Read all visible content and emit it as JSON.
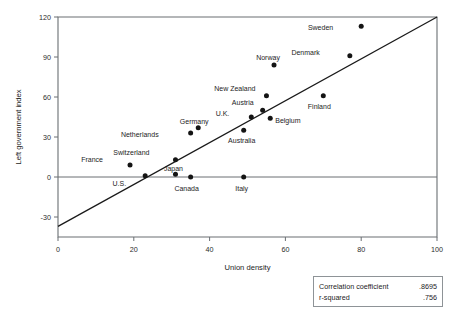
{
  "chart_data": {
    "type": "scatter",
    "title": "",
    "xlabel": "Union density",
    "ylabel": "Left government index",
    "xlim": [
      0,
      100
    ],
    "ylim": [
      -45,
      120
    ],
    "xticks": [
      0,
      20,
      40,
      60,
      80,
      100
    ],
    "yticks": [
      120,
      90,
      60,
      30,
      0,
      -30
    ],
    "grid": false,
    "legend": "none",
    "points": [
      {
        "label": "France",
        "x": 19,
        "y": 9,
        "label_dx": -27,
        "label_dy": -5
      },
      {
        "label": "U.S.",
        "x": 23,
        "y": 1,
        "label_dx": -19,
        "label_dy": 8
      },
      {
        "label": "Switzerland",
        "x": 31,
        "y": 13,
        "label_dx": -26,
        "label_dy": -7
      },
      {
        "label": "Japan",
        "x": 31,
        "y": 2,
        "label_dx": -2,
        "label_dy": -5
      },
      {
        "label": "Netherlands",
        "x": 35,
        "y": 33,
        "label_dx": -32,
        "label_dy": 2
      },
      {
        "label": "Canada",
        "x": 35,
        "y": 0,
        "label_dx": -4,
        "label_dy": 12
      },
      {
        "label": "Germany",
        "x": 37,
        "y": 37,
        "label_dx": -4,
        "label_dy": -6
      },
      {
        "label": "Italy",
        "x": 49,
        "y": 0,
        "label_dx": -2,
        "label_dy": 12
      },
      {
        "label": "Australia",
        "x": 49,
        "y": 35,
        "label_dx": -2,
        "label_dy": 11
      },
      {
        "label": "U.K.",
        "x": 51,
        "y": 45,
        "label_dx": -22,
        "label_dy": -3
      },
      {
        "label": "Austria",
        "x": 54,
        "y": 50,
        "label_dx": -9,
        "label_dy": -7
      },
      {
        "label": "Belgium",
        "x": 56,
        "y": 44,
        "label_dx": 5,
        "label_dy": 3
      },
      {
        "label": "New Zealand",
        "x": 55,
        "y": 61,
        "label_dx": -11,
        "label_dy": -7
      },
      {
        "label": "Norway",
        "x": 57,
        "y": 84,
        "label_dx": -6,
        "label_dy": -7
      },
      {
        "label": "Finland",
        "x": 70,
        "y": 61,
        "label_dx": -4,
        "label_dy": 11
      },
      {
        "label": "Denmark",
        "x": 77,
        "y": 91,
        "label_dx": -30,
        "label_dy": -3
      },
      {
        "label": "Sweden",
        "x": 80,
        "y": 113,
        "label_dx": -28,
        "label_dy": 2
      }
    ],
    "trend_line": {
      "x0": 0,
      "y0": -37,
      "x1": 100,
      "y1": 120
    }
  },
  "stats_box": {
    "rows": [
      {
        "label": "Correlation coefficient",
        "value": ".8695"
      },
      {
        "label": "r-squared",
        "value": ".756"
      }
    ]
  }
}
